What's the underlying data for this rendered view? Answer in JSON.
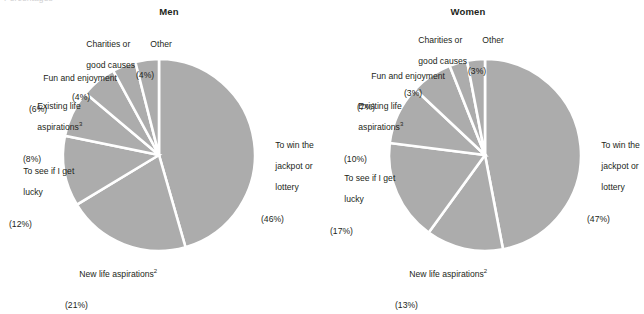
{
  "figure": {
    "clipped_header": "Percentages",
    "background_color": "#ffffff",
    "text_color": "#231f20",
    "slice_color": "#acacac",
    "slice_border_color": "#ffffff"
  },
  "panels": [
    {
      "key": "men",
      "title": "Men",
      "center_x": 159,
      "center_y": 155,
      "radius": 96
    },
    {
      "key": "women",
      "title": "Women",
      "center_x": 166,
      "center_y": 155,
      "radius": 96
    }
  ],
  "labels": {
    "men": {
      "win": {
        "name": "To win the",
        "line2": "jackpot or",
        "line3": "lottery",
        "pct": "(46%)"
      },
      "newlife": {
        "name": "New life aspirations",
        "sup": "2",
        "pct": "(21%)"
      },
      "lucky": {
        "name": "To see if I get",
        "line2": "lucky",
        "pct": "(12%)"
      },
      "existing": {
        "name": "Existing life",
        "line2": "aspirations",
        "sup": "3",
        "pct": "(8%)"
      },
      "fun": {
        "name": "Fun and enjoyment",
        "pct": "(6%)"
      },
      "charities": {
        "name": "Charities or",
        "line2": "good causes",
        "pct": "(4%)"
      },
      "other": {
        "name": "Other",
        "pct": "(4%)"
      }
    },
    "women": {
      "win": {
        "name": "To win the",
        "line2": "jackpot or",
        "line3": "lottery",
        "pct": "(47%)"
      },
      "newlife": {
        "name": "New life aspirations",
        "sup": "2",
        "pct": "(13%)"
      },
      "lucky": {
        "name": "To see if I get",
        "line2": "lucky",
        "pct": "(17%)"
      },
      "existing": {
        "name": "Existing life",
        "line2": "aspirations",
        "sup": "3",
        "pct": "(10%)"
      },
      "fun": {
        "name": "Fun and enjoyment",
        "pct": "(7%)"
      },
      "charities": {
        "name": "Charities or",
        "line2": "good causes",
        "pct": "(3%)"
      },
      "other": {
        "name": "Other",
        "pct": "(3%)"
      }
    }
  },
  "chart_data": {
    "type": "pie",
    "unit": "percent",
    "panels": [
      {
        "name": "Men",
        "categories": [
          "To win the jackpot or lottery",
          "New life aspirations",
          "To see if I get lucky",
          "Existing life aspirations",
          "Fun and enjoyment",
          "Charities or good causes",
          "Other"
        ],
        "values": [
          46,
          21,
          12,
          8,
          6,
          4,
          4
        ],
        "labels": [
          "(46%)",
          "(21%)",
          "(12%)",
          "(8%)",
          "(6%)",
          "(4%)",
          "(4%)"
        ],
        "start_angle_deg": 0,
        "direction": "clockwise"
      },
      {
        "name": "Women",
        "categories": [
          "To win the jackpot or lottery",
          "New life aspirations",
          "To see if I get lucky",
          "Existing life aspirations",
          "Fun and enjoyment",
          "Charities or good causes",
          "Other"
        ],
        "values": [
          47,
          13,
          17,
          10,
          7,
          3,
          3
        ],
        "labels": [
          "(47%)",
          "(13%)",
          "(17%)",
          "(10%)",
          "(7%)",
          "(3%)",
          "(3%)"
        ],
        "start_angle_deg": 0,
        "direction": "clockwise"
      }
    ],
    "legend": "none",
    "grid": false,
    "footnote_markers": [
      "2",
      "3"
    ]
  }
}
